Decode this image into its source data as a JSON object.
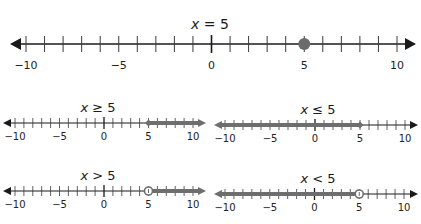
{
  "colors": {
    "axis": "#1a1a1a",
    "tick": "#3a3a3a",
    "highlight": "#6e6e6e",
    "point": "#6b6b6b",
    "background": "#ffffff"
  },
  "number_lines": [
    {
      "id": "main",
      "title_var": "x",
      "title_op": " = ",
      "title_val": "5",
      "relation": "=",
      "point": 5,
      "point_style": "closed",
      "shade": "none",
      "range": [
        -10,
        10
      ],
      "tick_labels": [
        "−10",
        "−5",
        "0",
        "5",
        "10"
      ],
      "geom": {
        "x_min": 26,
        "x_max": 397,
        "y": 44,
        "left_tip": 10,
        "right_tip": 416,
        "tick_h": 8,
        "title_x": 210,
        "title_y": 16,
        "label_y": 59
      }
    },
    {
      "id": "ge",
      "title_var": "x",
      "title_op": " ≥ ",
      "title_val": "5",
      "relation": ">=",
      "point": 5,
      "point_style": "closed",
      "shade": "right",
      "range": [
        -10,
        10
      ],
      "tick_labels": [
        "−10",
        "−5",
        "0",
        "5",
        "10"
      ],
      "geom": {
        "x_min": 15,
        "x_max": 193,
        "y": 123,
        "left_tip": 3,
        "right_tip": 206,
        "tick_h": 5,
        "title_x": 98,
        "title_y": 100,
        "label_y": 131
      }
    },
    {
      "id": "le",
      "title_var": "x",
      "title_op": " ≤ ",
      "title_val": "5",
      "relation": "<=",
      "point": 5,
      "point_style": "closed",
      "shade": "left",
      "range": [
        -10,
        10
      ],
      "tick_labels": [
        "−10",
        "−5",
        "0",
        "5",
        "10"
      ],
      "geom": {
        "x_min": 225,
        "x_max": 405,
        "y": 125,
        "left_tip": 214,
        "right_tip": 418,
        "tick_h": 5,
        "title_x": 318,
        "title_y": 102,
        "label_y": 133
      }
    },
    {
      "id": "gt",
      "title_var": "x",
      "title_op": " > ",
      "title_val": "5",
      "relation": ">",
      "point": 5,
      "point_style": "open",
      "shade": "right",
      "range": [
        -10,
        10
      ],
      "tick_labels": [
        "−10",
        "−5",
        "0",
        "5",
        "10"
      ],
      "geom": {
        "x_min": 15,
        "x_max": 193,
        "y": 191,
        "left_tip": 3,
        "right_tip": 206,
        "tick_h": 5,
        "title_x": 98,
        "title_y": 168,
        "label_y": 199
      }
    },
    {
      "id": "lt",
      "title_var": "x",
      "title_op": " < ",
      "title_val": "5",
      "relation": "<",
      "point": 5,
      "point_style": "open",
      "shade": "left",
      "range": [
        -10,
        10
      ],
      "tick_labels": [
        "−10",
        "−5",
        "0",
        "5",
        "10"
      ],
      "geom": {
        "x_min": 225,
        "x_max": 404,
        "y": 194,
        "left_tip": 214,
        "right_tip": 418,
        "tick_h": 5,
        "title_x": 318,
        "title_y": 171,
        "label_y": 202
      }
    }
  ]
}
